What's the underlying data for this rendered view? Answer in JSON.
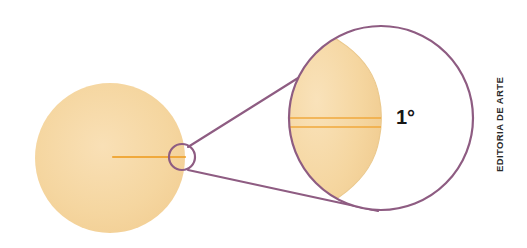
{
  "figure": {
    "background_color": "#ffffff",
    "width": 527,
    "height": 248
  },
  "labels": {
    "angle": "1°",
    "credit": "EDITORIA DE ARTE"
  },
  "colors": {
    "sun_fill": "#F5D6A0",
    "sun_fill_light": "#F8DFB2",
    "sun_radius_line": "#F0A93C",
    "outline_purple": "#8E5C82",
    "label_black": "#161616",
    "credit_gray": "#2a2a2a",
    "page_white": "#ffffff"
  },
  "shapes": {
    "sun_disc": {
      "name": "sun-disc",
      "cx": 110,
      "cy": 158,
      "r": 75,
      "fill": "#F5D6A0"
    },
    "sun_radius_line": {
      "name": "sun-radius-line",
      "x1": 112,
      "y1": 157,
      "x2": 184,
      "y2": 157,
      "color": "#F0A93C"
    },
    "magnifier_small_circle": {
      "name": "magnifier-small-circle",
      "cx": 182,
      "cy": 157,
      "r": 13,
      "stroke": "#8E5C82"
    },
    "magnified_circle": {
      "name": "magnified-circle",
      "cx": 381,
      "cy": 118,
      "r": 92,
      "stroke": "#8E5C82"
    },
    "magnified_sun_sector": {
      "name": "magnified-sun-sector",
      "fill": "#F5D6A0",
      "chord_x": 380,
      "description": "Left portion of magnified circle filled with sun color, bounded on the right by the sun's limb arc"
    },
    "magnified_radius_lines": [
      {
        "name": "magnified-radius-line-upper",
        "x1": 291,
        "y1": 118,
        "x2": 380,
        "y2": 118,
        "color": "#F0A93C"
      },
      {
        "name": "magnified-radius-line-lower",
        "x1": 293,
        "y1": 127,
        "x2": 380,
        "y2": 127,
        "color": "#F0A93C"
      }
    ],
    "connector_lines": [
      {
        "name": "connector-line-top",
        "x1": 189,
        "y1": 147,
        "x2": 380,
        "y2": 26,
        "color": "#8E5C82"
      },
      {
        "name": "connector-line-bottom",
        "x1": 189,
        "y1": 170,
        "x2": 377,
        "y2": 210,
        "color": "#8E5C82"
      }
    ]
  }
}
